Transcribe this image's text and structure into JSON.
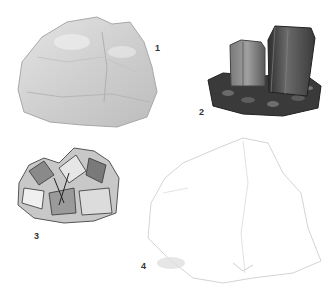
{
  "figure": {
    "specimens": [
      {
        "number": "1",
        "kind": "massive light-gray rock"
      },
      {
        "number": "2",
        "kind": "dark prismatic crystals on matrix"
      },
      {
        "number": "3",
        "kind": "crystal cluster"
      },
      {
        "number": "4",
        "kind": "massive white rock"
      }
    ]
  }
}
